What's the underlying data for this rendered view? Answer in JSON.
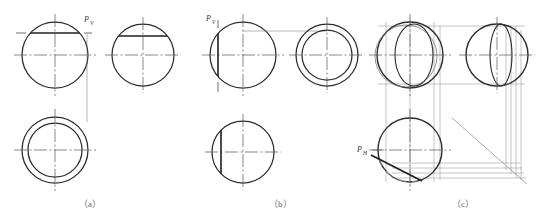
{
  "figure": {
    "background_color": "#ffffff",
    "line_color": "#2b2b2b",
    "thin_line_color": "#6a6a6a",
    "center_line_color": "#555555",
    "caption_color": "#6d6d6d"
  },
  "captions": [
    {
      "id": "caption-a",
      "text": "（a）",
      "x": 90,
      "y": 205
    },
    {
      "id": "caption-b",
      "text": "（b）",
      "x": 280,
      "y": 205
    },
    {
      "id": "caption-c",
      "text": "（c）",
      "x": 463,
      "y": 205
    }
  ],
  "labels": [
    {
      "id": "label-pv-a",
      "base": "P",
      "sub": "V",
      "x": 84,
      "y": 20,
      "panel": "a"
    },
    {
      "id": "label-pv-b",
      "base": "P",
      "sub": "V",
      "x": 209,
      "y": 20,
      "panel": "b"
    },
    {
      "id": "label-ph-c",
      "base": "P",
      "sub": "H",
      "x": 360,
      "y": 149,
      "panel": "c"
    }
  ],
  "panels": [
    {
      "id": "panel-a",
      "name": "panel-a-horizontal-cutting-plane",
      "caption": "（a）",
      "cut_label": "Pv",
      "cut_type": "horizontal plane",
      "views": [
        {
          "id": "a-front-view",
          "kind": "circle-with-horizontal-chord",
          "cx": 55,
          "cy": 55,
          "r": 33,
          "chord_y": 33
        },
        {
          "id": "a-side-view",
          "kind": "circle-with-horizontal-chord",
          "cx": 143,
          "cy": 55,
          "r": 31,
          "chord_y": 36
        },
        {
          "id": "a-top-view",
          "kind": "annulus",
          "cx": 55,
          "cy": 150,
          "r_outer": 33,
          "r_inner": 27
        }
      ]
    },
    {
      "id": "panel-b",
      "name": "panel-b-profile-cutting-plane",
      "caption": "（b）",
      "cut_label": "Pv",
      "cut_type": "profile plane",
      "views": [
        {
          "id": "b-front-view",
          "kind": "circle-with-vertical-chord",
          "cx": 243,
          "cy": 55,
          "r": 33,
          "chord_x": 218
        },
        {
          "id": "b-side-view",
          "kind": "annulus",
          "cx": 327,
          "cy": 55,
          "r_outer": 31,
          "r_inner": 25
        },
        {
          "id": "b-top-view",
          "kind": "circle-with-vertical-chord",
          "cx": 243,
          "cy": 152,
          "r": 31,
          "chord_x": 221
        }
      ]
    },
    {
      "id": "panel-c",
      "name": "panel-c-inclined-cutting-plane",
      "caption": "（c）",
      "cut_label": "PH",
      "cut_type": "inclined / frontal-projecting plane",
      "views": [
        {
          "id": "c-front-view",
          "kind": "circle-with-offset-ellipse",
          "cx": 410,
          "cy": 55,
          "r": 33
        },
        {
          "id": "c-side-view",
          "kind": "circle-with-right-ellipse",
          "cx": 497,
          "cy": 55,
          "r": 31
        },
        {
          "id": "c-top-view",
          "kind": "circle-with-diagonal-cut",
          "cx": 410,
          "cy": 150,
          "r": 32
        }
      ],
      "has_projection_box": true,
      "has_miter_line": true
    }
  ]
}
